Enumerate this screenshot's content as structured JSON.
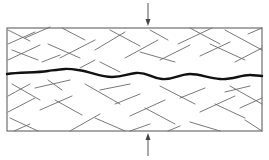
{
  "diagram": {
    "colors": {
      "background": "#ffffff",
      "frame": "#6e6e6e",
      "hatch": "#6a6a6a",
      "crack": "#111111",
      "arrow": "#444444"
    },
    "specimen": {
      "x": 7,
      "y": 28,
      "width": 255,
      "height": 103
    },
    "load_arrows": [
      {
        "name": "top-load-arrow",
        "x": 148,
        "y_from": 3,
        "y_to": 26,
        "direction": "down"
      },
      {
        "name": "bottom-load-arrow",
        "x": 148,
        "y_from": 156,
        "y_to": 133,
        "direction": "up"
      }
    ],
    "crack_path": "M7,74 C20,72 35,73 48,71 C62,69 66,68 78,70 C92,72 100,77 112,77 C124,77 126,74 136,73 C148,72 150,78 162,79 C174,80 180,74 190,74 C200,74 208,78 220,79 C232,80 240,75 250,75 C255,75 258,76 262,76",
    "hatch_segments": [
      [
        8,
        30,
        30,
        41
      ],
      [
        25,
        38,
        50,
        27
      ],
      [
        8,
        44,
        35,
        32
      ],
      [
        12,
        50,
        38,
        60
      ],
      [
        8,
        60,
        40,
        45
      ],
      [
        62,
        28,
        85,
        40
      ],
      [
        48,
        44,
        80,
        58
      ],
      [
        60,
        58,
        95,
        40
      ],
      [
        42,
        62,
        60,
        55
      ],
      [
        95,
        50,
        125,
        32
      ],
      [
        110,
        30,
        140,
        46
      ],
      [
        125,
        58,
        158,
        40
      ],
      [
        80,
        68,
        95,
        60
      ],
      [
        100,
        62,
        120,
        72
      ],
      [
        150,
        30,
        168,
        40
      ],
      [
        140,
        52,
        175,
        62
      ],
      [
        160,
        60,
        190,
        45
      ],
      [
        178,
        44,
        212,
        28
      ],
      [
        190,
        28,
        220,
        44
      ],
      [
        200,
        56,
        230,
        42
      ],
      [
        210,
        44,
        245,
        60
      ],
      [
        225,
        30,
        262,
        50
      ],
      [
        235,
        62,
        262,
        48
      ],
      [
        248,
        34,
        262,
        28
      ],
      [
        8,
        96,
        30,
        84
      ],
      [
        12,
        84,
        40,
        100
      ],
      [
        8,
        112,
        35,
        98
      ],
      [
        10,
        118,
        38,
        131
      ],
      [
        14,
        131,
        30,
        124
      ],
      [
        35,
        88,
        70,
        80
      ],
      [
        48,
        80,
        62,
        90
      ],
      [
        40,
        110,
        72,
        96
      ],
      [
        55,
        100,
        82,
        115
      ],
      [
        70,
        131,
        100,
        114
      ],
      [
        85,
        84,
        120,
        104
      ],
      [
        100,
        90,
        130,
        84
      ],
      [
        115,
        104,
        140,
        94
      ],
      [
        95,
        118,
        125,
        131
      ],
      [
        130,
        116,
        165,
        100
      ],
      [
        145,
        108,
        175,
        124
      ],
      [
        160,
        86,
        195,
        104
      ],
      [
        180,
        98,
        205,
        88
      ],
      [
        190,
        122,
        220,
        131
      ],
      [
        200,
        112,
        235,
        96
      ],
      [
        215,
        104,
        245,
        118
      ],
      [
        230,
        86,
        262,
        104
      ],
      [
        240,
        108,
        262,
        98
      ],
      [
        245,
        120,
        262,
        131
      ],
      [
        225,
        92,
        250,
        86
      ],
      [
        168,
        131,
        180,
        126
      ],
      [
        130,
        131,
        150,
        124
      ]
    ]
  }
}
